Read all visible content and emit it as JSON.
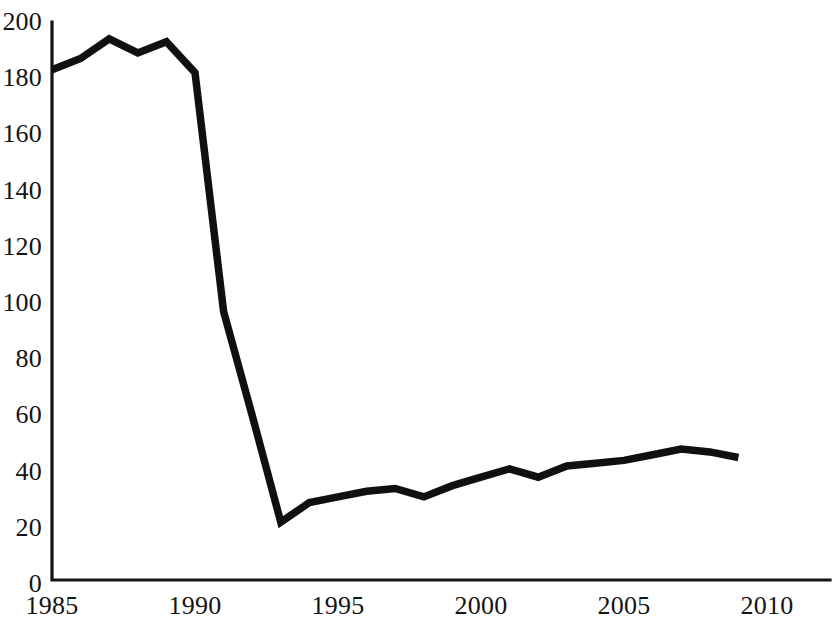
{
  "chart_data": {
    "type": "line",
    "title": "",
    "subtitle": "",
    "xlabel": "",
    "ylabel": "",
    "xlim": [
      1985,
      2010
    ],
    "ylim": [
      0,
      200
    ],
    "grid": false,
    "legend": null,
    "xticks": [
      "1985",
      "1990",
      "1995",
      "2000",
      "2005",
      "2010"
    ],
    "xtick_values": [
      1985,
      1990,
      1995,
      2000,
      2005,
      2010
    ],
    "yticks": [
      "0",
      "20",
      "40",
      "60",
      "80",
      "100",
      "120",
      "140",
      "160",
      "180",
      "200"
    ],
    "ytick_values": [
      0,
      20,
      40,
      60,
      80,
      100,
      120,
      140,
      160,
      180,
      200
    ],
    "x": [
      1985,
      1986,
      1987,
      1988,
      1989,
      1990,
      1991,
      1992,
      1993,
      1994,
      1995,
      1996,
      1997,
      1998,
      1999,
      2000,
      2001,
      2002,
      2003,
      2004,
      2005,
      2006,
      2007,
      2008,
      2009
    ],
    "values": [
      183,
      187,
      194,
      189,
      193,
      182,
      97,
      60,
      22,
      29,
      31,
      33,
      34,
      31,
      35,
      38,
      41,
      38,
      42,
      43,
      44,
      46,
      48,
      47,
      45
    ],
    "series": [
      {
        "name": "series-1",
        "color": "#101010",
        "values": [
          183,
          187,
          194,
          189,
          193,
          182,
          97,
          60,
          22,
          29,
          31,
          33,
          34,
          31,
          35,
          38,
          41,
          38,
          42,
          43,
          44,
          46,
          48,
          47,
          45
        ]
      }
    ]
  },
  "axes": {
    "y_axis_name": "y-axis",
    "x_axis_name": "x-axis"
  }
}
